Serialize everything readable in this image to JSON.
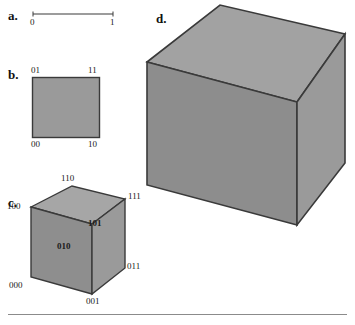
{
  "figure": {
    "background_color": "#ffffff",
    "ink_color": "#1a1a1a",
    "fill_gray": "#9a9a9a",
    "fill_gray_light": "#a6a6a6",
    "fill_gray_dark": "#8e8e8e",
    "edge_color": "#3a3a3a",
    "rule_color": "#8b8b8b"
  },
  "panels": {
    "a": {
      "letter": "a.",
      "kind": "line-segment",
      "endpoint_labels": [
        "0",
        "1"
      ]
    },
    "b": {
      "letter": "b.",
      "kind": "square",
      "corner_labels": {
        "top_left": "01",
        "top_right": "11",
        "bottom_left": "00",
        "bottom_right": "10"
      }
    },
    "c": {
      "letter": "c.",
      "kind": "cube-labeled",
      "vertex_labels": {
        "top_back": "110",
        "top_right": "111",
        "top_left": "100",
        "center_front_top": "101",
        "left_face": "010",
        "right_lower": "011",
        "bottom_left": "000",
        "bottom_front": "001"
      }
    },
    "d": {
      "letter": "d.",
      "kind": "cube-plain",
      "vertex_labels": {}
    }
  },
  "footer_rule": {
    "present": true
  }
}
